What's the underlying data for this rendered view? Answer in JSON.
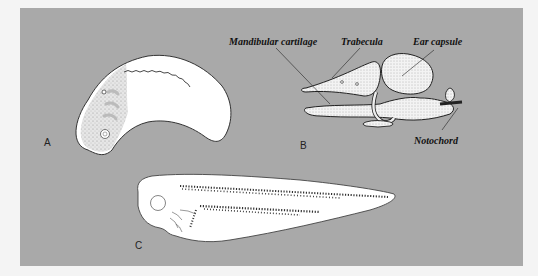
{
  "figure": {
    "panels": [
      {
        "id": "A",
        "label": "A",
        "description": "Early embryo (lateral view) with neural fold crest and branchial region"
      },
      {
        "id": "B",
        "label": "B",
        "description": "Chondrocranium lateral view"
      },
      {
        "id": "C",
        "label": "C",
        "description": "Tadpole larva with pigment bands"
      }
    ],
    "annotations": {
      "mandibular": "Mandibular cartilage",
      "trabecula": "Trabecula",
      "ear": "Ear capsule",
      "notochord": "Notochord"
    },
    "colors": {
      "panel_bg": "#a9a9a9",
      "page_bg": "#f4f4f4",
      "specimen_fill": "#ffffff",
      "ink": "#222222"
    }
  }
}
